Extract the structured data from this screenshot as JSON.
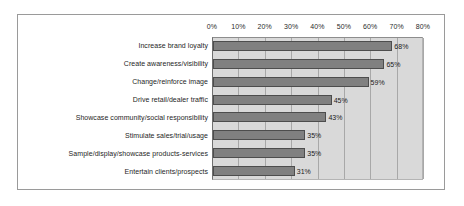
{
  "chart_data": {
    "type": "bar",
    "orientation": "horizontal",
    "title": "",
    "xlabel": "",
    "ylabel": "",
    "xlim": [
      0,
      80
    ],
    "xtick_labels": [
      "0%",
      "10%",
      "20%",
      "30%",
      "40%",
      "50%",
      "60%",
      "70%",
      "80%"
    ],
    "xticks": [
      0,
      10,
      20,
      30,
      40,
      50,
      60,
      70,
      80
    ],
    "grid": true,
    "legend": "none",
    "categories": [
      "Increase brand loyalty",
      "Create awareness/visibility",
      "Change/reinforce image",
      "Drive retail/dealer traffic",
      "Showcase community/social responsibility",
      "Stimulate sales/trial/usage",
      "Sample/display/showcase products-services",
      "Entertain clients/prospects"
    ],
    "values": [
      68,
      65,
      59,
      45,
      43,
      35,
      35,
      31
    ],
    "data_labels": [
      "68%",
      "65%",
      "59%",
      "45%",
      "43%",
      "35%",
      "35%",
      "31%"
    ],
    "colors": {
      "bar_fill": "#808080",
      "bar_border": "#4d4d4d",
      "plot_background": "#d9d9d9",
      "gridline": "#a8a8a8",
      "frame_border": "#9a9a9a",
      "page_background": "#ffffff",
      "text": "#1e1e1e"
    }
  }
}
